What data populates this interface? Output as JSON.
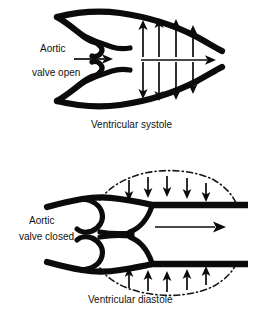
{
  "figure": {
    "title_visible": false,
    "background_color": "#ffffff",
    "ink_color": "#0b0b0b",
    "panels": [
      {
        "id": "systole",
        "caption": "Ventricular systole",
        "label_lines": [
          "Aortic",
          "valve open"
        ],
        "valve_state": "open",
        "wall_style": "solid-bulging",
        "arrows": {
          "top_row": {
            "direction": "up",
            "count": 4
          },
          "bottom_row": {
            "direction": "down",
            "count": 4
          },
          "axial": {
            "direction": "right",
            "count": 2,
            "note": "short arrow at valve, long arrow through ventricle"
          }
        }
      },
      {
        "id": "diastole",
        "caption": "Ventricular diastole",
        "label_lines": [
          "Aortic",
          "valve closed"
        ],
        "valve_state": "closed",
        "wall_style": "solid-straight-with-dashed-outline",
        "arrows": {
          "top_row": {
            "direction": "down",
            "count": 5
          },
          "bottom_row": {
            "direction": "up",
            "count": 5
          },
          "axial": {
            "direction": "right",
            "count": 1
          }
        }
      }
    ]
  }
}
